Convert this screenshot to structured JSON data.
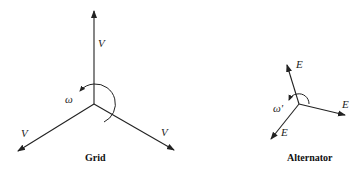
{
  "diagram": {
    "type": "phasor-diagram",
    "grid": {
      "caption": "Grid",
      "center": [
        94,
        104
      ],
      "phasor_label": "V",
      "rotation_label": "ω",
      "phasors": [
        {
          "label": "V",
          "tip": [
            94,
            10
          ]
        },
        {
          "label": "V",
          "tip": [
            17,
            152
          ]
        },
        {
          "label": "V",
          "tip": [
            175,
            151
          ]
        }
      ]
    },
    "alternator": {
      "caption": "Alternator",
      "center": [
        299,
        104
      ],
      "phasor_label": "E",
      "rotation_label": "ω'",
      "phasors": [
        {
          "label": "E",
          "tip": [
            287,
            64
          ]
        },
        {
          "label": "E",
          "tip": [
            346,
            115
          ]
        },
        {
          "label": "E",
          "tip": [
            270,
            140
          ]
        }
      ]
    }
  }
}
